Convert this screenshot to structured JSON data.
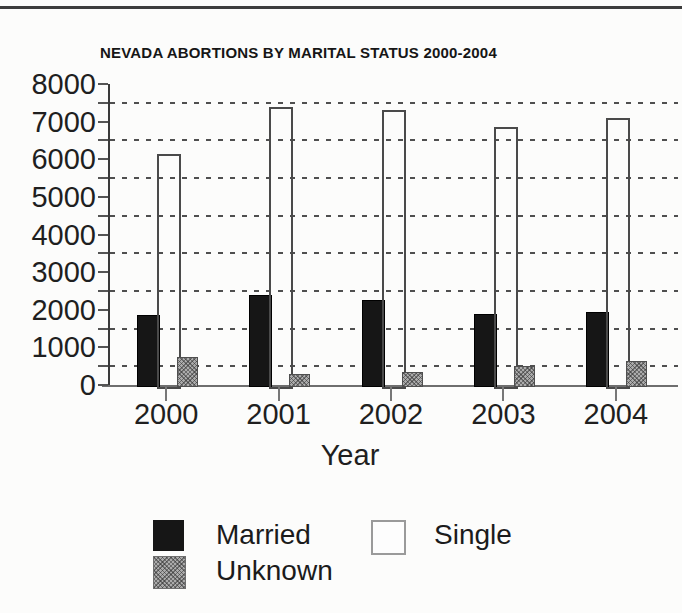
{
  "page": {
    "background": "#fcfcfb",
    "top_rule_color": "#3c3c3c"
  },
  "chart_data": {
    "type": "bar",
    "title": "NEVADA ABORTIONS BY MARITAL STATUS 2000-2004",
    "xlabel": "Year",
    "ylabel": "",
    "categories": [
      "2000",
      "2001",
      "2002",
      "2003",
      "2004"
    ],
    "series": [
      {
        "name": "Married",
        "style": "solid",
        "color": "#161616",
        "values": [
          1850,
          2400,
          2250,
          1900,
          1950
        ]
      },
      {
        "name": "Single",
        "style": "outline",
        "color": "#ffffff",
        "values": [
          6150,
          7400,
          7300,
          6850,
          7100
        ]
      },
      {
        "name": "Unknown",
        "style": "halftone",
        "color": "#ababab",
        "values": [
          750,
          300,
          350,
          500,
          650
        ]
      }
    ],
    "ylim": [
      0,
      8000
    ],
    "yticks_labeled": [
      0,
      1000,
      2000,
      3000,
      4000,
      5000,
      6000,
      7000,
      8000
    ],
    "ytick_minor_step": 500,
    "gridlines": "dashed horizontal at 500, 1500, 2500, 3500, 4500, 5500, 6500, 7500",
    "legend_position": "below"
  },
  "legend": {
    "married_label": "Married",
    "single_label": "Single",
    "unknown_label": "Unknown"
  }
}
